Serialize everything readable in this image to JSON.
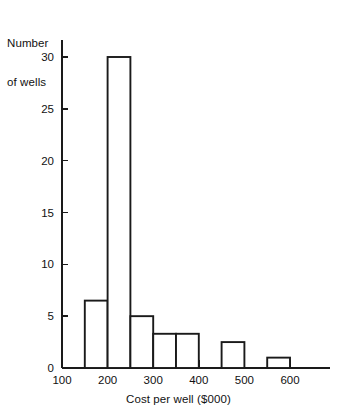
{
  "chart_data": {
    "type": "bar",
    "title": "",
    "subtitle": "",
    "xlabel": "Cost per well ($000)",
    "ylabel": "Number\nof wells",
    "ylabel_lines": [
      "Number",
      "of wells"
    ],
    "xlim": [
      100,
      630
    ],
    "ylim": [
      0,
      31
    ],
    "grid": false,
    "legend": null,
    "bar_style": "unfilled-outline",
    "bin_width": 50,
    "x_ticks_major": [
      100,
      200,
      300,
      400,
      500,
      600
    ],
    "x_tick_labels": [
      "100",
      "200",
      "300",
      "400",
      "500",
      "600"
    ],
    "x_ticks_minor": [
      150,
      250,
      350,
      450,
      550
    ],
    "y_ticks": [
      0,
      5,
      10,
      15,
      20,
      25,
      30
    ],
    "y_tick_labels": [
      "0",
      "5",
      "10",
      "15",
      "20",
      "25",
      "30"
    ],
    "bins": [
      {
        "start": 150,
        "end": 200,
        "value": 6.5
      },
      {
        "start": 200,
        "end": 250,
        "value": 30
      },
      {
        "start": 250,
        "end": 300,
        "value": 5
      },
      {
        "start": 300,
        "end": 350,
        "value": 3.3
      },
      {
        "start": 350,
        "end": 400,
        "value": 3.3
      },
      {
        "start": 450,
        "end": 500,
        "value": 2.5
      },
      {
        "start": 550,
        "end": 600,
        "value": 1
      }
    ],
    "categories": [
      "150-200",
      "200-250",
      "250-300",
      "300-350",
      "350-400",
      "450-500",
      "550-600"
    ],
    "values": [
      6.5,
      30,
      5,
      3.3,
      3.3,
      2.5,
      1
    ],
    "colors": {
      "bar_fill": "#ffffff",
      "bar_stroke": "#1a1a1a",
      "axis": "#1a1a1a",
      "text": "#111111",
      "background": "#ffffff"
    }
  }
}
